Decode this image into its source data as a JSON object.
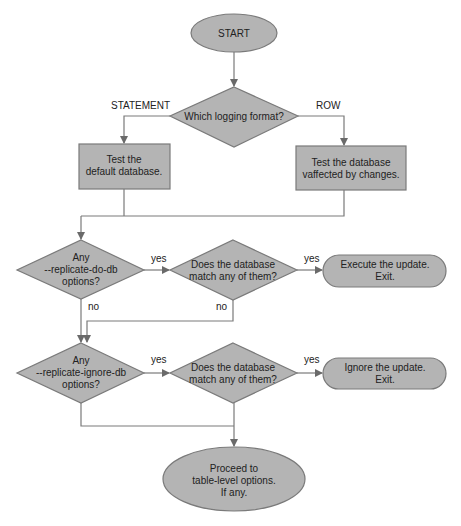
{
  "colors": {
    "node_fill": "#b4b4b4",
    "node_stroke": "#7a7a7a",
    "line": "#7a7a7a",
    "text": "#222222",
    "background": "#ffffff"
  },
  "nodes": {
    "start": {
      "shape": "ellipse",
      "lines": [
        "START"
      ]
    },
    "format_decision": {
      "shape": "diamond",
      "lines": [
        "Which logging format?"
      ]
    },
    "test_default_db": {
      "shape": "rect",
      "lines": [
        "Test the",
        "default database."
      ]
    },
    "test_affected_db": {
      "shape": "rect",
      "lines": [
        "Test the database",
        "vaffected by changes."
      ]
    },
    "do_db_decision": {
      "shape": "diamond",
      "lines": [
        "Any",
        "--replicate-do-db",
        "options?"
      ]
    },
    "do_db_match": {
      "shape": "diamond",
      "lines": [
        "Does the database",
        "match any of them?"
      ]
    },
    "execute_update": {
      "shape": "terminal",
      "lines": [
        "Execute the update.",
        "Exit."
      ]
    },
    "ignore_db_decision": {
      "shape": "diamond",
      "lines": [
        "Any",
        "--replicate-ignore-db",
        "options?"
      ]
    },
    "ignore_db_match": {
      "shape": "diamond",
      "lines": [
        "Does the database",
        "match any of them?"
      ]
    },
    "ignore_update": {
      "shape": "terminal",
      "lines": [
        "Ignore the update.",
        "Exit."
      ]
    },
    "proceed": {
      "shape": "ellipse",
      "lines": [
        "Proceed to",
        "table-level options.",
        "If any."
      ]
    }
  },
  "edge_labels": {
    "statement": "STATEMENT",
    "row": "ROW",
    "do_db_yes": "yes",
    "do_db_no": "no",
    "do_match_yes": "yes",
    "do_match_no": "no",
    "ignore_db_yes": "yes",
    "ignore_match_yes": "yes"
  },
  "edges": [
    {
      "from": "start",
      "to": "format_decision"
    },
    {
      "from": "format_decision",
      "to": "test_default_db",
      "label": "STATEMENT"
    },
    {
      "from": "format_decision",
      "to": "test_affected_db",
      "label": "ROW"
    },
    {
      "from": "test_default_db",
      "to": "do_db_decision"
    },
    {
      "from": "test_affected_db",
      "to": "do_db_decision"
    },
    {
      "from": "do_db_decision",
      "to": "do_db_match",
      "label": "yes"
    },
    {
      "from": "do_db_decision",
      "to": "ignore_db_decision",
      "label": "no"
    },
    {
      "from": "do_db_match",
      "to": "execute_update",
      "label": "yes"
    },
    {
      "from": "do_db_match",
      "to": "ignore_db_decision",
      "label": "no"
    },
    {
      "from": "ignore_db_decision",
      "to": "ignore_db_match",
      "label": "yes"
    },
    {
      "from": "ignore_db_decision",
      "to": "proceed"
    },
    {
      "from": "ignore_db_match",
      "to": "ignore_update",
      "label": "yes"
    },
    {
      "from": "ignore_db_match",
      "to": "proceed"
    }
  ]
}
